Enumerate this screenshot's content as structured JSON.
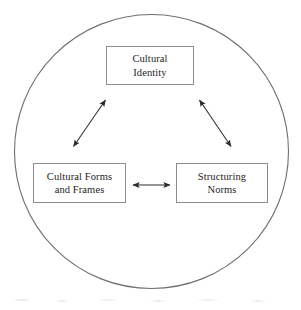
{
  "diagram": {
    "type": "triad-relationship-diagram",
    "colors": {
      "background": "#ffffff",
      "box_border": "#8d8d8d",
      "circle_border": "#6f6f6f",
      "arrow": "#2a2a2a",
      "text": "#1d1d1d"
    },
    "boundary": {
      "shape": "circle",
      "label": "enclosing-circle",
      "center_x": 151,
      "center_y": 151,
      "radius": 137
    },
    "nodes": [
      {
        "id": "cultural-identity",
        "lines": [
          "Cultural",
          "Identity"
        ],
        "line1": "Cultural",
        "line2": "Identity",
        "position": "top"
      },
      {
        "id": "cultural-forms",
        "lines": [
          "Cultural Forms",
          "and Frames"
        ],
        "line1": "Cultural Forms",
        "line2": "and Frames",
        "position": "bottom-left"
      },
      {
        "id": "structuring-norms",
        "lines": [
          "Structuring",
          "Norms"
        ],
        "line1": "Structuring",
        "line2": "Norms",
        "position": "bottom-right"
      }
    ],
    "connectors": [
      {
        "id": "identity-to-forms",
        "from": "cultural-identity",
        "to": "cultural-forms",
        "style": "double-headed-arrow",
        "orientation": "diagonal"
      },
      {
        "id": "identity-to-norms",
        "from": "cultural-identity",
        "to": "structuring-norms",
        "style": "double-headed-arrow",
        "orientation": "diagonal"
      },
      {
        "id": "forms-to-norms",
        "from": "cultural-forms",
        "to": "structuring-norms",
        "style": "double-headed-arrow",
        "orientation": "horizontal"
      }
    ]
  }
}
